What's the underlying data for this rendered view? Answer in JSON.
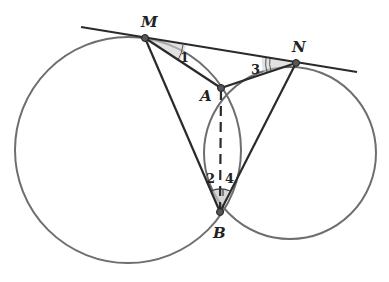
{
  "diagram": {
    "type": "geometry",
    "colors": {
      "circle": "#6e6e6e",
      "line": "#2a2a2a",
      "point": "#555555",
      "shade": "#bdbdbd"
    },
    "points": {
      "M": {
        "label": "M",
        "x": 145,
        "y": 38
      },
      "N": {
        "label": "N",
        "x": 296,
        "y": 63
      },
      "A": {
        "label": "A",
        "x": 221,
        "y": 88
      },
      "B": {
        "label": "B",
        "x": 220,
        "y": 212
      }
    },
    "circles": [
      {
        "name": "left-circle",
        "cx": 128,
        "cy": 150,
        "r": 113
      },
      {
        "name": "right-circle",
        "cx": 290,
        "cy": 153,
        "r": 86
      }
    ],
    "tangent_line": {
      "x1": 81,
      "y1": 27,
      "x2": 357,
      "y2": 72
    },
    "segments": [
      "MA",
      "MB",
      "NA",
      "NB"
    ],
    "dashed_segments": [
      "AB"
    ],
    "angle_labels": [
      {
        "label": "1",
        "x": 181,
        "y": 62
      },
      {
        "label": "2",
        "x": 206,
        "y": 183
      },
      {
        "label": "3",
        "x": 251,
        "y": 74
      },
      {
        "label": "4",
        "x": 226,
        "y": 183
      }
    ]
  }
}
